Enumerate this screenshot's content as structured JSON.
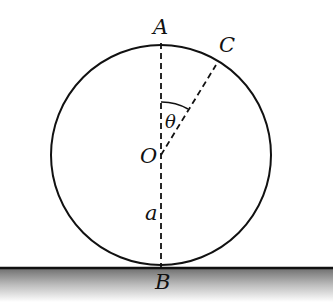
{
  "diagram": {
    "type": "geometry",
    "labels": {
      "top": "A",
      "point_on_circle": "C",
      "angle": "θ",
      "center": "O",
      "radius": "a",
      "bottom": "B"
    },
    "colors": {
      "stroke": "#111111",
      "ground_top": "#6e6e6e",
      "ground_bottom": "#ffffff"
    }
  }
}
